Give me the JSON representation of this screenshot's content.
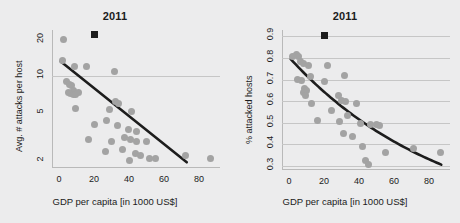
{
  "figure": {
    "background_color": "#ececed",
    "point_color": "#a3a3a3",
    "trend_color": "#1d1d1d",
    "grid_color": "#c6c6c6",
    "marker_color": "#1d1d1d"
  },
  "chart_data": [
    {
      "type": "scatter",
      "panel": "left",
      "title": "2011",
      "xlabel": "GDP per capita [in 1000 US$]",
      "ylabel": "Avg. # attacks per host",
      "xlim": [
        -4,
        92
      ],
      "ylim": [
        1.75,
        24
      ],
      "yscale": "log",
      "xscale": "linear",
      "xticks": [
        0,
        20,
        40,
        60,
        80
      ],
      "yticks": [
        2,
        5,
        10,
        20
      ],
      "grid": "y-gridline at 10 only",
      "legend": "none",
      "annotation_marker": {
        "shape": "square",
        "x": 20,
        "y": 22,
        "color": "#1d1d1d"
      },
      "points": [
        {
          "x": 2.5,
          "y": 20.0
        },
        {
          "x": 2.0,
          "y": 13.5
        },
        {
          "x": 9.0,
          "y": 12.0
        },
        {
          "x": 15.5,
          "y": 12.0
        },
        {
          "x": 31.5,
          "y": 11.0
        },
        {
          "x": 4.5,
          "y": 9.0
        },
        {
          "x": 6.0,
          "y": 8.6
        },
        {
          "x": 7.0,
          "y": 8.3
        },
        {
          "x": 8.5,
          "y": 7.6
        },
        {
          "x": 5.5,
          "y": 7.3
        },
        {
          "x": 6.5,
          "y": 7.2
        },
        {
          "x": 8.0,
          "y": 7.0
        },
        {
          "x": 9.5,
          "y": 7.0
        },
        {
          "x": 11.0,
          "y": 7.3
        },
        {
          "x": 32.5,
          "y": 6.2
        },
        {
          "x": 34.0,
          "y": 6.0
        },
        {
          "x": 9.5,
          "y": 5.4
        },
        {
          "x": 29.0,
          "y": 5.3
        },
        {
          "x": 41.5,
          "y": 5.1
        },
        {
          "x": 20.0,
          "y": 4.0
        },
        {
          "x": 27.0,
          "y": 4.3
        },
        {
          "x": 33.5,
          "y": 3.9
        },
        {
          "x": 39.5,
          "y": 3.6
        },
        {
          "x": 44.0,
          "y": 3.5
        },
        {
          "x": 17.0,
          "y": 3.0
        },
        {
          "x": 30.0,
          "y": 2.9
        },
        {
          "x": 37.5,
          "y": 3.1
        },
        {
          "x": 41.0,
          "y": 3.0
        },
        {
          "x": 44.5,
          "y": 2.9
        },
        {
          "x": 50.0,
          "y": 2.9
        },
        {
          "x": 26.5,
          "y": 2.4
        },
        {
          "x": 36.0,
          "y": 2.5
        },
        {
          "x": 43.5,
          "y": 2.3
        },
        {
          "x": 46.5,
          "y": 2.2
        },
        {
          "x": 51.5,
          "y": 2.1
        },
        {
          "x": 40.5,
          "y": 2.0
        },
        {
          "x": 55.0,
          "y": 2.1
        },
        {
          "x": 72.0,
          "y": 2.2
        },
        {
          "x": 86.5,
          "y": 2.1
        }
      ],
      "trend_line": {
        "shape": "straight-line-on-log-y",
        "x_start": 1.0,
        "y_start": 13.2,
        "x_end": 73.0,
        "y_end": 1.95
      }
    },
    {
      "type": "scatter",
      "panel": "right",
      "title": "2011",
      "xlabel": "GDP per capita [in 1000 US$]",
      "ylabel": "% attacked hosts",
      "xlim": [
        -4,
        92
      ],
      "ylim": [
        0.28,
        0.93
      ],
      "yscale": "linear",
      "xscale": "linear",
      "xticks": [
        0,
        20,
        40,
        60,
        80
      ],
      "yticks": [
        0.3,
        0.4,
        0.5,
        0.6,
        0.7,
        0.8,
        0.9
      ],
      "grid": "horizontal gridlines at every y tick",
      "legend": "none",
      "annotation_marker": {
        "shape": "square",
        "x": 20,
        "y": 0.905,
        "color": "#1d1d1d"
      },
      "points": [
        {
          "x": 2.0,
          "y": 0.805
        },
        {
          "x": 4.0,
          "y": 0.815
        },
        {
          "x": 5.5,
          "y": 0.805
        },
        {
          "x": 6.5,
          "y": 0.785
        },
        {
          "x": 8.5,
          "y": 0.775
        },
        {
          "x": 11.0,
          "y": 0.765
        },
        {
          "x": 22.0,
          "y": 0.765
        },
        {
          "x": 5.0,
          "y": 0.7
        },
        {
          "x": 7.0,
          "y": 0.695
        },
        {
          "x": 12.0,
          "y": 0.715
        },
        {
          "x": 31.5,
          "y": 0.72
        },
        {
          "x": 9.0,
          "y": 0.66
        },
        {
          "x": 10.0,
          "y": 0.65
        },
        {
          "x": 8.0,
          "y": 0.64
        },
        {
          "x": 9.5,
          "y": 0.625
        },
        {
          "x": 20.0,
          "y": 0.69
        },
        {
          "x": 28.0,
          "y": 0.625
        },
        {
          "x": 30.0,
          "y": 0.605
        },
        {
          "x": 32.5,
          "y": 0.6
        },
        {
          "x": 13.0,
          "y": 0.59
        },
        {
          "x": 38.5,
          "y": 0.59
        },
        {
          "x": 24.5,
          "y": 0.555
        },
        {
          "x": 33.5,
          "y": 0.535
        },
        {
          "x": 16.5,
          "y": 0.51
        },
        {
          "x": 29.0,
          "y": 0.505
        },
        {
          "x": 41.0,
          "y": 0.495
        },
        {
          "x": 46.5,
          "y": 0.49
        },
        {
          "x": 50.0,
          "y": 0.49
        },
        {
          "x": 51.5,
          "y": 0.485
        },
        {
          "x": 31.0,
          "y": 0.45
        },
        {
          "x": 36.5,
          "y": 0.435
        },
        {
          "x": 42.0,
          "y": 0.39
        },
        {
          "x": 55.0,
          "y": 0.36
        },
        {
          "x": 71.0,
          "y": 0.38
        },
        {
          "x": 86.5,
          "y": 0.36
        },
        {
          "x": 43.5,
          "y": 0.325
        },
        {
          "x": 45.5,
          "y": 0.305
        }
      ],
      "trend_line": {
        "shape": "convex-decreasing-curve",
        "x_start": 1.0,
        "y_start": 0.795,
        "x_end": 87.0,
        "y_end": 0.305
      }
    }
  ]
}
